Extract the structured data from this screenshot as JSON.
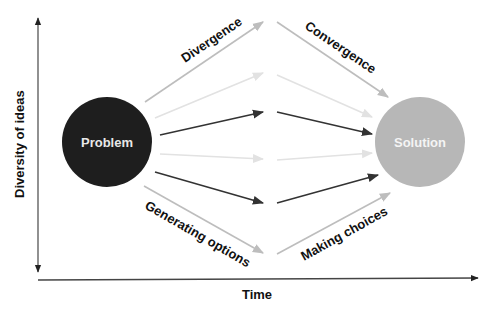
{
  "diagram": {
    "axes": {
      "y_label": "Diversity of ideas",
      "x_label": "Time"
    },
    "nodes": {
      "problem": {
        "label": "Problem",
        "fill": "#1e1e1e",
        "text_color": "#e8e8e8"
      },
      "solution": {
        "label": "Solution",
        "fill": "#b7b7b7",
        "text_color": "#f2f2f2"
      }
    },
    "phase_labels": {
      "divergence": "Divergence",
      "convergence": "Convergence",
      "generating_options": "Generating options",
      "making_choices": "Making choices"
    },
    "colors": {
      "dark_arrow": "#333333",
      "mid_arrow": "#bdbdbd",
      "light_arrow": "#e2e2e2",
      "axis": "#222222"
    }
  }
}
